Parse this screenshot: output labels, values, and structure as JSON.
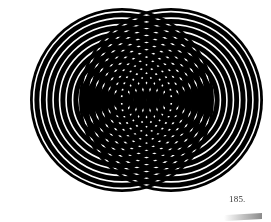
{
  "figure": {
    "ring_sets": [
      {
        "name": "left-rings",
        "cx": 122,
        "cy": 100,
        "outer_radius": 92,
        "ring_period": 6.5
      },
      {
        "name": "right-rings",
        "cx": 171,
        "cy": 100,
        "outer_radius": 92,
        "ring_period": 6.5
      }
    ],
    "colors": {
      "ink": "#000000",
      "paper": "#ffffff"
    }
  },
  "page": {
    "number": "185."
  }
}
